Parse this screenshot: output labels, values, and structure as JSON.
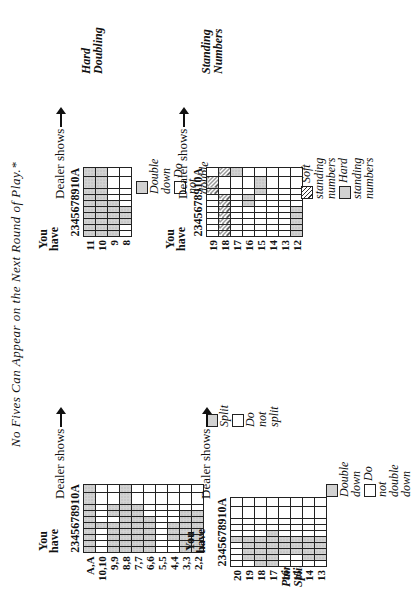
{
  "caption": "No Fives Can Appear on the Next Round of Play.*",
  "common": {
    "you_have": "You have",
    "dealer_shows": "Dealer shows",
    "dealer_cols": [
      "2",
      "3",
      "4",
      "5",
      "6",
      "7",
      "8",
      "9",
      "10",
      "A"
    ]
  },
  "pair_splitting": {
    "title": "Pair Splitting",
    "rows": [
      "A,A",
      "10,10",
      "9,9",
      "8,8",
      "7,7",
      "6,6",
      "5,5",
      "4,4",
      "3,3",
      "2,2"
    ],
    "legend": {
      "shaded": "Split",
      "blank": "Do not split"
    },
    "cells": [
      [
        1,
        1,
        1,
        1,
        1,
        1,
        1,
        1,
        1,
        1
      ],
      [
        0,
        0,
        0,
        0,
        1,
        0,
        0,
        0,
        0,
        0
      ],
      [
        1,
        1,
        1,
        1,
        1,
        0,
        1,
        1,
        0,
        0
      ],
      [
        1,
        1,
        1,
        1,
        1,
        1,
        1,
        1,
        1,
        1
      ],
      [
        1,
        1,
        1,
        1,
        1,
        1,
        1,
        1,
        0,
        0
      ],
      [
        1,
        1,
        1,
        1,
        1,
        1,
        0,
        0,
        0,
        0
      ],
      [
        0,
        0,
        0,
        0,
        0,
        0,
        0,
        0,
        0,
        0
      ],
      [
        0,
        0,
        1,
        1,
        1,
        0,
        0,
        0,
        0,
        0
      ],
      [
        1,
        1,
        1,
        1,
        1,
        1,
        1,
        0,
        0,
        0
      ],
      [
        1,
        1,
        1,
        1,
        1,
        1,
        1,
        0,
        0,
        0
      ]
    ]
  },
  "soft_doubling": {
    "title": "Soft Doubling",
    "rows": [
      "20",
      "19",
      "18",
      "17",
      "16",
      "15",
      "14",
      "13"
    ],
    "legend": {
      "shaded": "Double down",
      "blank": "Do not double down"
    },
    "cells": [
      [
        0,
        0,
        0,
        0,
        1,
        0,
        0,
        0,
        0,
        0
      ],
      [
        0,
        1,
        1,
        1,
        1,
        0,
        0,
        0,
        0,
        0
      ],
      [
        1,
        1,
        1,
        1,
        1,
        0,
        0,
        0,
        0,
        0
      ],
      [
        1,
        1,
        1,
        1,
        1,
        1,
        0,
        0,
        0,
        0
      ],
      [
        0,
        0,
        1,
        1,
        1,
        0,
        0,
        0,
        0,
        0
      ],
      [
        0,
        0,
        1,
        1,
        1,
        0,
        0,
        0,
        0,
        0
      ],
      [
        0,
        1,
        1,
        1,
        1,
        0,
        0,
        0,
        0,
        0
      ],
      [
        0,
        1,
        1,
        1,
        1,
        0,
        0,
        0,
        0,
        0
      ]
    ]
  },
  "hard_doubling": {
    "title": "Hard Doubling",
    "rows": [
      "11",
      "10",
      "9",
      "8"
    ],
    "legend": {
      "shaded": "Double down",
      "blank": "Do not double down"
    },
    "cells": [
      [
        1,
        1,
        1,
        1,
        1,
        1,
        1,
        1,
        1,
        1
      ],
      [
        1,
        1,
        1,
        1,
        1,
        1,
        1,
        1,
        1,
        1
      ],
      [
        1,
        1,
        1,
        1,
        1,
        1,
        0,
        0,
        0,
        0
      ],
      [
        0,
        0,
        1,
        1,
        1,
        0,
        0,
        0,
        0,
        0
      ]
    ]
  },
  "standing_numbers": {
    "title": "Standing Numbers",
    "rows": [
      "19",
      "18",
      "17",
      "16",
      "15",
      "14",
      "13",
      "12"
    ],
    "legend": {
      "soft": "Soft standing numbers",
      "hard": "Hard standing numbers"
    },
    "cells": [
      [
        "",
        "",
        "",
        "",
        "",
        "",
        "",
        "h",
        "h",
        ""
      ],
      [
        "h",
        "h",
        "h",
        "h",
        "h",
        "h",
        "h",
        "",
        "",
        "h"
      ],
      [
        "",
        "",
        "",
        "",
        "",
        "",
        "",
        "",
        "",
        "s"
      ],
      [
        "",
        "",
        "",
        "",
        "",
        "s",
        "s",
        "",
        "",
        ""
      ],
      [
        "",
        "",
        "",
        "",
        "",
        "",
        "",
        "s",
        "s",
        ""
      ],
      [
        "",
        "",
        "",
        "",
        "",
        "",
        "",
        "",
        "",
        ""
      ],
      [
        "",
        "",
        "",
        "",
        "",
        "",
        "",
        "",
        "",
        ""
      ],
      [
        "s",
        "s",
        "s",
        "s",
        "s",
        "",
        "",
        "",
        "",
        ""
      ]
    ]
  }
}
